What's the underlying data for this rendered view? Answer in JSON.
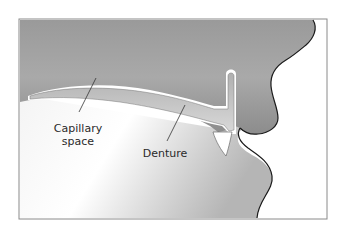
{
  "figure": {
    "labels": {
      "capillary_space_line1": "Capillary",
      "capillary_space_line2": "space",
      "denture": "Denture"
    },
    "colors": {
      "upper_tissue": "#8a8a8a",
      "lower_tissue": "#c8c8c8",
      "denture": "#bdbdbd",
      "outline": "#1a1a1a",
      "frame": "#7a7a7a",
      "background": "#ffffff"
    }
  }
}
